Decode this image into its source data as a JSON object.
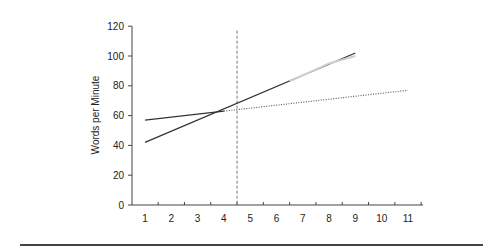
{
  "chart_data": {
    "type": "line",
    "title": "",
    "xlabel": "",
    "ylabel": "Words per Minute",
    "xlim": [
      0.5,
      11.5
    ],
    "ylim": [
      0,
      120
    ],
    "x_ticks": [
      1,
      2,
      3,
      4,
      5,
      6,
      7,
      8,
      9,
      10,
      11
    ],
    "y_ticks": [
      0,
      20,
      40,
      60,
      80,
      100,
      120
    ],
    "grid": false,
    "legend": null,
    "series": [
      {
        "name": "steep-trend-solid",
        "style": "solid",
        "color": "#333333",
        "x": [
          1,
          9
        ],
        "y": [
          42,
          102
        ]
      },
      {
        "name": "flat-trend-solid",
        "style": "solid",
        "color": "#333333",
        "x": [
          1,
          4
        ],
        "y": [
          57,
          63
        ]
      },
      {
        "name": "flat-trend-projection-dotted",
        "style": "dotted",
        "color": "#555555",
        "x": [
          4,
          11
        ],
        "y": [
          63,
          77
        ]
      },
      {
        "name": "faint-overlay",
        "style": "solid",
        "color": "#cfcfcf",
        "x": [
          6.5,
          8,
          9
        ],
        "y": [
          83,
          95,
          100
        ]
      }
    ],
    "annotations": [
      {
        "type": "vertical-dashed-line",
        "x": 4.5,
        "y_from": 0,
        "y_to": 117,
        "color": "#777777"
      }
    ]
  }
}
